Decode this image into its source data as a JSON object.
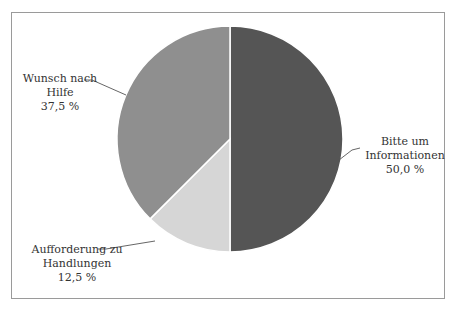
{
  "chart_data": {
    "type": "pie",
    "title": "",
    "categories": [
      "Bitte um Informationen",
      "Aufforderung zu Handlungen",
      "Wunsch nach Hilfe"
    ],
    "values": [
      50.0,
      12.5,
      37.5
    ],
    "value_labels": [
      "50,0 %",
      "12,5 %",
      "37,5 %"
    ],
    "colors": [
      "#555555",
      "#d6d6d6",
      "#8f8f8f"
    ],
    "start_angle": "12 o'clock",
    "direction": "clockwise",
    "legend": "none (leader-line labels)"
  },
  "labels": {
    "informationen": {
      "line1": "Bitte um",
      "line2": "Informationen",
      "value": "50,0 %"
    },
    "handlungen": {
      "line1": "Aufforderung zu",
      "line2": "Handlungen",
      "value": "12,5 %"
    },
    "hilfe": {
      "line1": "Wunsch nach",
      "line2": "Hilfe",
      "value": "37,5 %"
    }
  }
}
